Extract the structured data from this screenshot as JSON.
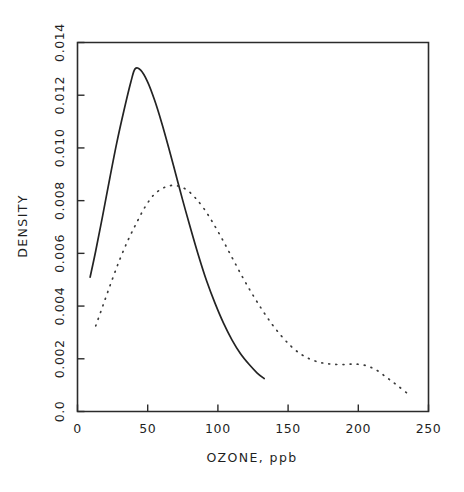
{
  "chart_data": {
    "type": "line",
    "title": "",
    "xlabel": "OZONE, ppb",
    "ylabel": "DENSITY",
    "xlim": [
      0,
      250
    ],
    "ylim": [
      0.0,
      0.014
    ],
    "grid": false,
    "legend": "none",
    "xticks": [
      0,
      50,
      100,
      150,
      200,
      250
    ],
    "xtick_labels": [
      "0",
      "50",
      "100",
      "150",
      "200",
      "250"
    ],
    "yticks": [
      0.0,
      0.002,
      0.004,
      0.006,
      0.008,
      0.01,
      0.012,
      0.014
    ],
    "ytick_labels": [
      "0.0",
      "0.002",
      "0.004",
      "0.006",
      "0.008",
      "0.010",
      "0.012",
      "0.014"
    ],
    "series": [
      {
        "name": "solid-density-curve",
        "style": "solid",
        "color": "#232323",
        "x": [
          9,
          13,
          18,
          23,
          28,
          33,
          38,
          41,
          45,
          50,
          55,
          60,
          65,
          70,
          75,
          80,
          86,
          92,
          98,
          104,
          110,
          116,
          122,
          128,
          133
        ],
        "y": [
          0.0051,
          0.0061,
          0.00745,
          0.00885,
          0.0102,
          0.0114,
          0.0125,
          0.013,
          0.01295,
          0.0125,
          0.0118,
          0.01095,
          0.01,
          0.009,
          0.008,
          0.00705,
          0.00595,
          0.00495,
          0.0041,
          0.00335,
          0.00272,
          0.0022,
          0.0018,
          0.00146,
          0.00125
        ]
      },
      {
        "name": "dotted-density-curve",
        "style": "dotted",
        "color": "#3a3a3a",
        "x": [
          13,
          18,
          24,
          30,
          36,
          42,
          48,
          54,
          60,
          66,
          72,
          78,
          84,
          90,
          96,
          103,
          110,
          117,
          124,
          131,
          138,
          145,
          152,
          159,
          166,
          173,
          180,
          188,
          196,
          204,
          212,
          220,
          228,
          237
        ],
        "y": [
          0.00325,
          0.004,
          0.0049,
          0.00575,
          0.0065,
          0.00715,
          0.00775,
          0.0082,
          0.00845,
          0.00857,
          0.00855,
          0.0084,
          0.0081,
          0.0077,
          0.0072,
          0.00655,
          0.00585,
          0.00515,
          0.0045,
          0.0039,
          0.00335,
          0.00288,
          0.00248,
          0.00218,
          0.00198,
          0.00186,
          0.0018,
          0.00178,
          0.0018,
          0.00176,
          0.0016,
          0.0013,
          0.00098,
          0.0006
        ]
      }
    ]
  }
}
